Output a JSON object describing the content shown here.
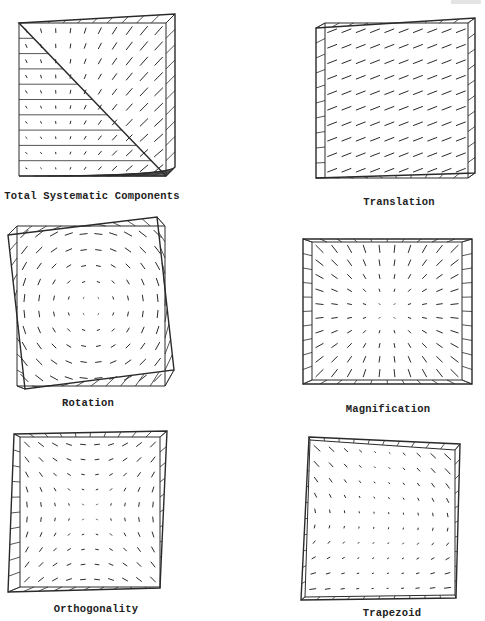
{
  "figure": {
    "panels": [
      {
        "id": "total",
        "caption": "Total Systematic Components",
        "caption_pos": [
          92,
          197
        ],
        "outline": [
          [
            19,
            23
          ],
          [
            166,
            23
          ],
          [
            166,
            176
          ],
          [
            19,
            176
          ]
        ],
        "shifted": [
          [
            19,
            23
          ],
          [
            175,
            14
          ],
          [
            175,
            167
          ],
          [
            166,
            176
          ]
        ],
        "field": "total"
      },
      {
        "id": "translation",
        "caption": "Translation",
        "caption_pos": [
          399,
          203
        ],
        "outline": [
          [
            325,
            23
          ],
          [
            468,
            23
          ],
          [
            468,
            178
          ],
          [
            325,
            178
          ]
        ],
        "shifted": [
          [
            316,
            28
          ],
          [
            475,
            18
          ],
          [
            475,
            173
          ],
          [
            316,
            178
          ]
        ],
        "field": "translation"
      },
      {
        "id": "rotation",
        "caption": "Rotation",
        "caption_pos": [
          88,
          404
        ],
        "outline": [
          [
            17,
            226
          ],
          [
            165,
            226
          ],
          [
            165,
            386
          ],
          [
            17,
            386
          ]
        ],
        "shifted": [
          [
            8,
            235
          ],
          [
            157,
            217
          ],
          [
            174,
            370
          ],
          [
            25,
            389
          ]
        ],
        "field": "rotation"
      },
      {
        "id": "magnification",
        "caption": "Magnification",
        "caption_pos": [
          388,
          410
        ],
        "outline": [
          [
            312,
            242
          ],
          [
            462,
            242
          ],
          [
            462,
            380
          ],
          [
            312,
            380
          ]
        ],
        "shifted": [
          [
            303,
            239
          ],
          [
            472,
            239
          ],
          [
            472,
            384
          ],
          [
            303,
            384
          ]
        ],
        "field": "magnification"
      },
      {
        "id": "orthogonality",
        "caption": "Orthogonality",
        "caption_pos": [
          96,
          610
        ],
        "outline": [
          [
            20,
            437
          ],
          [
            160,
            437
          ],
          [
            160,
            587
          ],
          [
            20,
            587
          ]
        ],
        "shifted": [
          [
            14,
            434
          ],
          [
            167,
            431
          ],
          [
            160,
            588
          ],
          [
            8,
            592
          ]
        ],
        "field": "orthogonality"
      },
      {
        "id": "trapezoid",
        "caption": "Trapezoid",
        "caption_pos": [
          392,
          614
        ],
        "outline": [
          [
            310,
            440
          ],
          [
            455,
            450
          ],
          [
            455,
            595
          ],
          [
            305,
            597
          ]
        ],
        "shifted": [
          [
            309,
            437
          ],
          [
            460,
            444
          ],
          [
            456,
            598
          ],
          [
            301,
            600
          ]
        ],
        "field": "trapezoid"
      }
    ],
    "grid": {
      "rows": 10,
      "cols": 10
    },
    "colors": {
      "ink": "#2a2a2a",
      "background": "#ffffff"
    }
  }
}
